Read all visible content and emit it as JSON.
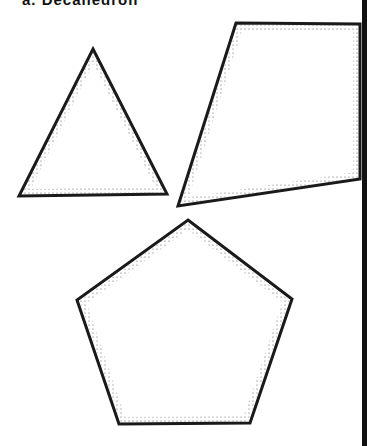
{
  "caption": "a. Decahedron",
  "shapes": [
    {
      "name": "triangle",
      "points": "93,49 167,194 19,196"
    },
    {
      "name": "quadrilateral",
      "points": "236,23 360,24 360,179 178,206"
    },
    {
      "name": "pentagon",
      "points": "188,220 292,299 250,423 119,424 77,300"
    }
  ],
  "colors": {
    "stroke": "#1a1a1a",
    "fill": "#ffffff",
    "stipple": "#555555"
  }
}
